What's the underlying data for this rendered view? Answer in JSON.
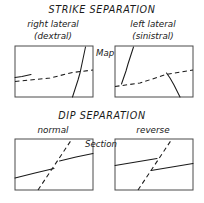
{
  "figure": {
    "name": "fault-separation-diagram",
    "background_color": "#ffffff",
    "ink_color": "#1a1a1a",
    "box_stroke_color": "#4a4a4a"
  },
  "sections": [
    {
      "id": "strike-separation",
      "title": "STRIKE  SEPARATION",
      "view_label": "Map",
      "view_label_pos": {
        "x": 102,
        "y": 55
      },
      "title_pos": {
        "x": 102,
        "y": 13
      },
      "panels": [
        {
          "id": "right-lateral",
          "caption_line1": "right lateral",
          "caption_line2": "(dextral)",
          "caption1_pos": {
            "x": 53,
            "y": 27
          },
          "caption2_pos": {
            "x": 53,
            "y": 39
          },
          "box": {
            "x": 15,
            "y": 46,
            "w": 78,
            "h": 51
          },
          "fault_type": "dashed",
          "solid_label": "offset-bed",
          "dashed_label": "fault-trace"
        },
        {
          "id": "left-lateral",
          "caption_line1": "left lateral",
          "caption_line2": "(sinistral)",
          "caption1_pos": {
            "x": 153,
            "y": 27
          },
          "caption2_pos": {
            "x": 153,
            "y": 39
          },
          "box": {
            "x": 115,
            "y": 46,
            "w": 78,
            "h": 51
          },
          "fault_type": "dashed",
          "solid_label": "offset-bed",
          "dashed_label": "fault-trace"
        }
      ]
    },
    {
      "id": "dip-separation",
      "title": "DIP  SEPARATION",
      "view_label": "Section",
      "view_label_pos": {
        "x": 104,
        "y": 144
      },
      "title_pos": {
        "x": 102,
        "y": 119
      },
      "panels": [
        {
          "id": "normal",
          "caption_line1": "normal",
          "caption_line2": "",
          "caption1_pos": {
            "x": 53,
            "y": 133
          },
          "caption2_pos": {
            "x": 53,
            "y": 133
          },
          "box": {
            "x": 15,
            "y": 139,
            "w": 78,
            "h": 51
          },
          "fault_type": "dashed",
          "solid_label": "offset-bed",
          "dashed_label": "fault-trace"
        },
        {
          "id": "reverse",
          "caption_line1": "reverse",
          "caption_line2": "",
          "caption1_pos": {
            "x": 153,
            "y": 133
          },
          "caption2_pos": {
            "x": 153,
            "y": 133
          },
          "box": {
            "x": 115,
            "y": 139,
            "w": 78,
            "h": 51
          },
          "fault_type": "dashed",
          "solid_label": "offset-bed",
          "dashed_label": "fault-trace"
        }
      ]
    }
  ],
  "geometry": {
    "right_lateral": {
      "fault_dashed": "M 15,81 L 93,70",
      "bed_upper": "M 72,97 L 85,47",
      "bed_lower": "M 15,77 L 31,74"
    },
    "left_lateral": {
      "fault_dashed": "M 115,87 L 193,70",
      "bed_upper": "M 133,47 L 122,81",
      "bed_lower": "M 180,97 L 167,73"
    },
    "normal": {
      "fault_dashed": "M 38,190 L 72,139",
      "bed_left": "M 15,178 L 54,168",
      "bed_right": "M 60,163 L 93,154"
    },
    "reverse": {
      "fault_dashed": "M 138,190 L 172,139",
      "bed_left": "M 115,165 L 157,158",
      "bed_right": "M 152,170 L 193,163"
    }
  }
}
